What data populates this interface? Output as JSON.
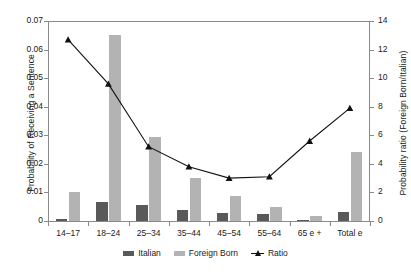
{
  "chart_data": {
    "type": "bar",
    "title": "",
    "subtitle": "",
    "xlabel": "",
    "ylabel": "Probability of Receiving a Sentence",
    "y2label": "Probability ratio (Foreign Born/Italian)",
    "categories": [
      "14–17",
      "18–24",
      "25–34",
      "35–44",
      "45–54",
      "55–64",
      "65 e +",
      "Total e"
    ],
    "ylim": [
      0,
      0.07
    ],
    "y2lim": [
      0,
      14
    ],
    "yticks": [
      "0",
      "0.01",
      "0.02",
      "0.03",
      "0.04",
      "0.05",
      "0.06",
      "0.07"
    ],
    "ytick_values": [
      0,
      0.01,
      0.02,
      0.03,
      0.04,
      0.05,
      0.06,
      0.07
    ],
    "y2ticks": [
      "0",
      "2",
      "4",
      "6",
      "8",
      "10",
      "12",
      "14"
    ],
    "y2tick_values": [
      0,
      2,
      4,
      6,
      8,
      10,
      12,
      14
    ],
    "grid": false,
    "legend_position": "bottom",
    "series": [
      {
        "name": "Italian",
        "type": "bar",
        "axis": "left",
        "color": "#595959",
        "values": [
          0.0006,
          0.0068,
          0.0057,
          0.004,
          0.0029,
          0.0023,
          0.0004,
          0.003
        ]
      },
      {
        "name": "Foreign Born",
        "type": "bar",
        "axis": "left",
        "color": "#b3b3b3",
        "values": [
          0.0102,
          0.065,
          0.0293,
          0.015,
          0.0089,
          0.0048,
          0.0019,
          0.024
        ]
      },
      {
        "name": "Ratio",
        "type": "line",
        "axis": "right",
        "color": "#111111",
        "marker": "triangle",
        "values": [
          12.7,
          9.6,
          5.2,
          3.8,
          3.0,
          3.1,
          5.6,
          7.9
        ]
      }
    ]
  },
  "legend": {
    "items": [
      {
        "label": "Italian",
        "swatch": "bar-dark-swatch"
      },
      {
        "label": "Foreign Born",
        "swatch": "bar-light-swatch"
      },
      {
        "label": "Ratio",
        "swatch": "line-triangle-swatch"
      }
    ]
  }
}
